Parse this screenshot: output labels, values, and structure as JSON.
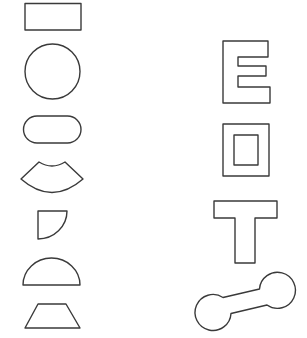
{
  "figure": {
    "background": "#ffffff",
    "stroke_color": "#3a3a3a",
    "left_column": {
      "shapes": [
        {
          "id": "rectangle",
          "label": "rectangle"
        },
        {
          "id": "circle",
          "label": "circle"
        },
        {
          "id": "stadium",
          "label": "rounded rectangle"
        },
        {
          "id": "annular-sector",
          "label": "annular sector"
        },
        {
          "id": "quarter-circle",
          "label": "quarter circle"
        },
        {
          "id": "semicircle",
          "label": "semicircle"
        },
        {
          "id": "trapezoid",
          "label": "trapezoid"
        }
      ]
    },
    "right_column": {
      "shapes": [
        {
          "id": "letter-e",
          "label": "letter E outline"
        },
        {
          "id": "framed-rectangle",
          "label": "rectangle with rectangular hole"
        },
        {
          "id": "letter-t",
          "label": "letter T outline"
        },
        {
          "id": "dumbbell",
          "label": "dumbbell"
        }
      ]
    }
  }
}
